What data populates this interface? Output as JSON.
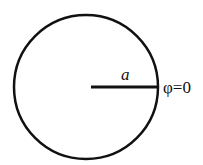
{
  "diagram": {
    "shape": "circle",
    "circle": {
      "cx": 86,
      "cy": 87,
      "r": 72,
      "stroke": "#111111",
      "stroke_width": 2.5
    },
    "radius_line": {
      "x1": 91,
      "y1": 87,
      "x2": 158,
      "y2": 87,
      "stroke_width": 3
    },
    "labels": {
      "radius": "a",
      "boundary_condition": "φ=0"
    }
  }
}
